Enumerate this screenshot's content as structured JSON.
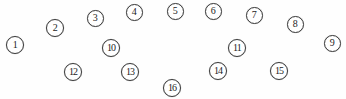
{
  "figure": {
    "kind": "numbered-node-scatter",
    "width": 346,
    "height": 99,
    "background_color": "#fefefe",
    "marker_outline_color": "#3a3a3a",
    "marker_fill_color": "#ffffff",
    "label_color": "#1c1c1c",
    "nodes": [
      {
        "label": "1",
        "x": 15,
        "y": 45,
        "d": 18,
        "font_size": 10
      },
      {
        "label": "2",
        "x": 55,
        "y": 28,
        "d": 18,
        "font_size": 10
      },
      {
        "label": "3",
        "x": 95,
        "y": 18,
        "d": 17,
        "font_size": 10
      },
      {
        "label": "4",
        "x": 134,
        "y": 12,
        "d": 17,
        "font_size": 10
      },
      {
        "label": "5",
        "x": 175,
        "y": 11,
        "d": 17,
        "font_size": 10
      },
      {
        "label": "6",
        "x": 213,
        "y": 11,
        "d": 17,
        "font_size": 10
      },
      {
        "label": "7",
        "x": 254,
        "y": 15,
        "d": 17,
        "font_size": 10
      },
      {
        "label": "8",
        "x": 295,
        "y": 24,
        "d": 17,
        "font_size": 10
      },
      {
        "label": "9",
        "x": 332,
        "y": 43,
        "d": 17,
        "font_size": 10
      },
      {
        "label": "10",
        "x": 111,
        "y": 48,
        "d": 18,
        "font_size": 10
      },
      {
        "label": "11",
        "x": 237,
        "y": 48,
        "d": 18,
        "font_size": 10
      },
      {
        "label": "12",
        "x": 73,
        "y": 72,
        "d": 18,
        "font_size": 10
      },
      {
        "label": "13",
        "x": 130,
        "y": 72,
        "d": 18,
        "font_size": 10
      },
      {
        "label": "14",
        "x": 218,
        "y": 71,
        "d": 18,
        "font_size": 10
      },
      {
        "label": "15",
        "x": 279,
        "y": 71,
        "d": 18,
        "font_size": 10
      },
      {
        "label": "16",
        "x": 172,
        "y": 88,
        "d": 18,
        "font_size": 10
      }
    ]
  }
}
